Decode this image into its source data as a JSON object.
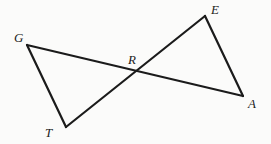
{
  "figure": {
    "background_color": "#fbfbfa",
    "stroke_color": "#1b1b1b",
    "stroke_width": 2.2,
    "width": 271,
    "height": 144
  },
  "labels": {
    "G": "G",
    "T": "T",
    "E": "E",
    "A": "A",
    "R": "R"
  },
  "chart_data": {
    "type": "diagram",
    "points": {
      "G": {
        "x": 27,
        "y": 45
      },
      "T": {
        "x": 66,
        "y": 127
      },
      "E": {
        "x": 205,
        "y": 16
      },
      "A": {
        "x": 243,
        "y": 96
      },
      "R": {
        "x": 133,
        "y": 72
      }
    },
    "segments": [
      {
        "name": "GA",
        "from": "G",
        "to": "A"
      },
      {
        "name": "TE",
        "from": "T",
        "to": "E"
      },
      {
        "name": "GT",
        "from": "G",
        "to": "T"
      },
      {
        "name": "EA",
        "from": "E",
        "to": "A"
      }
    ],
    "label_offsets": {
      "G": {
        "x": 14,
        "y": 31
      },
      "T": {
        "x": 45,
        "y": 126
      },
      "E": {
        "x": 211,
        "y": 3
      },
      "A": {
        "x": 248,
        "y": 97
      },
      "R": {
        "x": 128,
        "y": 53
      }
    }
  }
}
